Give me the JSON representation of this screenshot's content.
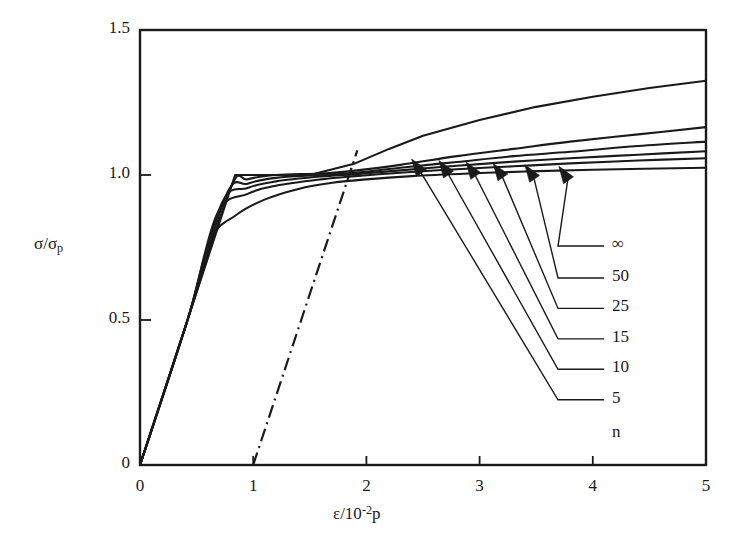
{
  "chart_data": {
    "type": "line",
    "title": "",
    "xlabel": "ε/10⁻²p",
    "ylabel": "σ/σp",
    "xlabel_parts": {
      "base": "ε/10",
      "exp": "-2",
      "tail": "p"
    },
    "ylabel_parts": {
      "base": "σ/σ",
      "sub": "p"
    },
    "xlim": [
      0,
      5
    ],
    "ylim": [
      0,
      1.5
    ],
    "xticks": [
      0,
      1,
      2,
      3,
      4,
      5
    ],
    "xtick_labels": [
      "0",
      "1",
      "2",
      "3",
      "4",
      "5"
    ],
    "yticks": [
      0,
      0.5,
      1.0,
      1.5
    ],
    "ytick_labels": [
      "0",
      "0.5",
      "1.0",
      "1.5"
    ],
    "grid": false,
    "legend_position": "inside-right",
    "legend_title": "n",
    "series": [
      {
        "name": "∞",
        "n": "infinity",
        "points": [
          [
            0,
            0
          ],
          [
            0.42,
            0.5
          ],
          [
            0.84,
            1.0
          ],
          [
            1.1,
            1.0
          ],
          [
            1.5,
            1.0
          ],
          [
            1.9,
            1.04
          ],
          [
            2.2,
            1.09
          ],
          [
            2.5,
            1.135
          ],
          [
            3.0,
            1.19
          ],
          [
            3.5,
            1.235
          ],
          [
            4.0,
            1.27
          ],
          [
            4.5,
            1.3
          ],
          [
            5.0,
            1.325
          ]
        ]
      },
      {
        "name": "50",
        "n": 50,
        "points": [
          [
            0,
            0
          ],
          [
            0.42,
            0.5
          ],
          [
            0.8,
            0.955
          ],
          [
            0.95,
            0.985
          ],
          [
            1.2,
            1.0
          ],
          [
            1.6,
            1.005
          ],
          [
            1.9,
            1.015
          ],
          [
            2.3,
            1.035
          ],
          [
            2.8,
            1.065
          ],
          [
            3.3,
            1.09
          ],
          [
            3.8,
            1.115
          ],
          [
            4.4,
            1.14
          ],
          [
            5.0,
            1.165
          ]
        ]
      },
      {
        "name": "25",
        "n": 25,
        "points": [
          [
            0,
            0
          ],
          [
            0.42,
            0.5
          ],
          [
            0.76,
            0.93
          ],
          [
            0.95,
            0.97
          ],
          [
            1.2,
            0.99
          ],
          [
            1.6,
            1.0
          ],
          [
            1.9,
            1.008
          ],
          [
            2.3,
            1.025
          ],
          [
            2.8,
            1.045
          ],
          [
            3.3,
            1.065
          ],
          [
            3.8,
            1.08
          ],
          [
            4.4,
            1.1
          ],
          [
            5.0,
            1.115
          ]
        ]
      },
      {
        "name": "15",
        "n": 15,
        "points": [
          [
            0,
            0
          ],
          [
            0.42,
            0.5
          ],
          [
            0.72,
            0.9
          ],
          [
            0.95,
            0.955
          ],
          [
            1.2,
            0.978
          ],
          [
            1.6,
            0.995
          ],
          [
            1.9,
            1.003
          ],
          [
            2.3,
            1.016
          ],
          [
            2.8,
            1.032
          ],
          [
            3.3,
            1.046
          ],
          [
            3.8,
            1.058
          ],
          [
            4.4,
            1.07
          ],
          [
            5.0,
            1.082
          ]
        ]
      },
      {
        "name": "10",
        "n": 10,
        "points": [
          [
            0,
            0
          ],
          [
            0.42,
            0.5
          ],
          [
            0.68,
            0.865
          ],
          [
            0.95,
            0.935
          ],
          [
            1.2,
            0.963
          ],
          [
            1.6,
            0.985
          ],
          [
            1.9,
            0.996
          ],
          [
            2.3,
            1.008
          ],
          [
            2.8,
            1.02
          ],
          [
            3.3,
            1.03
          ],
          [
            3.8,
            1.04
          ],
          [
            4.4,
            1.05
          ],
          [
            5.0,
            1.058
          ]
        ]
      },
      {
        "name": "5",
        "n": 5,
        "points": [
          [
            0,
            0
          ],
          [
            0.42,
            0.5
          ],
          [
            0.62,
            0.775
          ],
          [
            0.85,
            0.862
          ],
          [
            1.1,
            0.915
          ],
          [
            1.4,
            0.952
          ],
          [
            1.7,
            0.973
          ],
          [
            2.0,
            0.985
          ],
          [
            2.4,
            0.996
          ],
          [
            2.9,
            1.005
          ],
          [
            3.4,
            1.012
          ],
          [
            4.0,
            1.018
          ],
          [
            5.0,
            1.025
          ]
        ]
      }
    ],
    "reference_line": {
      "style": "dash-dot",
      "name": "offset-yield-line",
      "points": [
        [
          1.0,
          0.0
        ],
        [
          1.92,
          1.085
        ]
      ]
    },
    "annotations": [
      {
        "label": "∞",
        "arrow_tip": [
          3.7,
          1.03
        ],
        "label_xy": [
          4.3,
          0.755
        ]
      },
      {
        "label": "50",
        "arrow_tip": [
          3.4,
          1.035
        ],
        "label_xy": [
          4.3,
          0.645
        ]
      },
      {
        "label": "25",
        "arrow_tip": [
          3.12,
          1.04
        ],
        "label_xy": [
          4.3,
          0.54
        ]
      },
      {
        "label": "15",
        "arrow_tip": [
          2.88,
          1.045
        ],
        "label_xy": [
          4.3,
          0.435
        ]
      },
      {
        "label": "10",
        "arrow_tip": [
          2.64,
          1.05
        ],
        "label_xy": [
          4.3,
          0.33
        ]
      },
      {
        "label": "5",
        "arrow_tip": [
          2.4,
          1.055
        ],
        "label_xy": [
          4.3,
          0.225
        ]
      }
    ]
  }
}
